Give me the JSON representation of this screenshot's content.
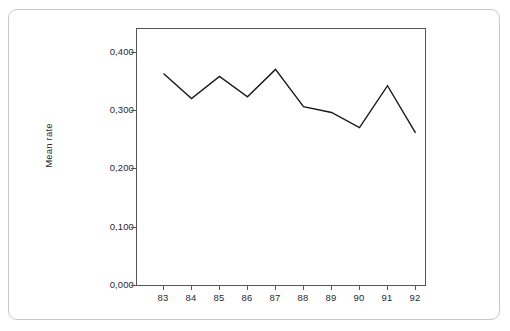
{
  "chart_data": {
    "type": "line",
    "title": "",
    "subtitle": "",
    "xlabel": "",
    "ylabel": "Mean rate",
    "categories": [
      "83",
      "84",
      "85",
      "86",
      "87",
      "88",
      "89",
      "90",
      "91",
      "92"
    ],
    "values": [
      0.364,
      0.321,
      0.359,
      0.324,
      0.371,
      0.307,
      0.297,
      0.271,
      0.343,
      0.262
    ],
    "series": [
      {
        "name": "Mean rate",
        "values": [
          0.364,
          0.321,
          0.359,
          0.324,
          0.371,
          0.307,
          0.297,
          0.271,
          0.343,
          0.262
        ]
      }
    ],
    "ylim": [
      0.0,
      0.45
    ],
    "yticks": [
      0.0,
      0.1,
      0.2,
      0.3,
      0.4
    ],
    "ytick_labels": [
      "0,000",
      "0,100",
      "0,200",
      "0,300",
      "0,400"
    ],
    "xtick_labels": [
      "83",
      "84",
      "85",
      "86",
      "87",
      "88",
      "89",
      "90",
      "91",
      "92"
    ],
    "grid": false,
    "legend": false,
    "legend_position": "none",
    "line_color": "#1a1a1a",
    "frame_color": "#555555",
    "background_color": "#ffffff",
    "decimal_separator": ","
  },
  "figure": {
    "outer_border_color": "#c9c9c9"
  }
}
